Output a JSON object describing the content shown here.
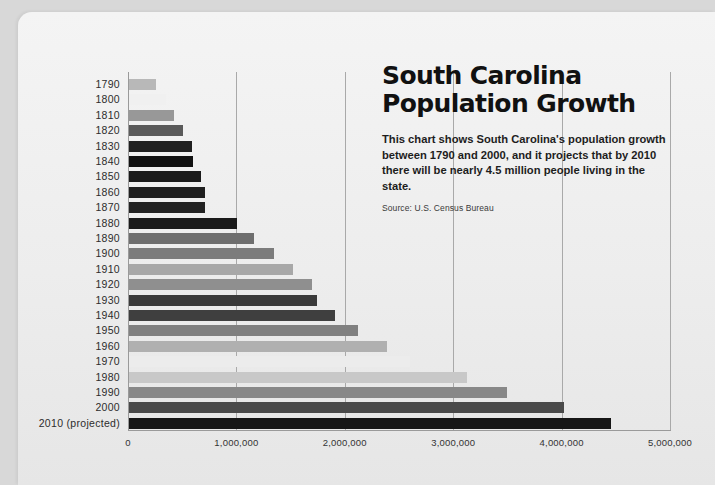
{
  "header": {
    "title_line1": "South Carolina",
    "title_line2": "Population Growth",
    "description": "This chart shows South Carolina's population growth between 1790 and 2000, and it projects that by 2010 there will be nearly 4.5 million people living in the state.",
    "source": "Source: U.S. Census Bureau"
  },
  "axis": {
    "xticks": [
      "0",
      "1,000,000",
      "2,000,000",
      "3,000,000",
      "4,000,000",
      "5,000,000"
    ]
  },
  "chart_data": {
    "type": "bar",
    "orientation": "horizontal",
    "title": "South Carolina Population Growth",
    "xlabel": "",
    "ylabel": "",
    "xlim": [
      0,
      5000000
    ],
    "grid": true,
    "legend": false,
    "categories": [
      "1790",
      "1800",
      "1810",
      "1820",
      "1830",
      "1840",
      "1850",
      "1860",
      "1870",
      "1880",
      "1890",
      "1900",
      "1910",
      "1920",
      "1930",
      "1940",
      "1950",
      "1960",
      "1970",
      "1980",
      "1990",
      "2000",
      "2010 (projected)"
    ],
    "values": [
      249073,
      345591,
      415115,
      502741,
      581185,
      594398,
      668507,
      703708,
      705606,
      995577,
      1151149,
      1340316,
      1515400,
      1683724,
      1738765,
      1899804,
      2117027,
      2382594,
      2590516,
      3121820,
      3486703,
      4012012,
      4446704
    ],
    "bar_colors": [
      "#b8b8b8",
      "#f0f0f0",
      "#989898",
      "#5a5a5a",
      "#202020",
      "#111111",
      "#1a1a1a",
      "#1f1f1f",
      "#222222",
      "#1a1a1a",
      "#6e6e6e",
      "#7c7c7c",
      "#a8a8a8",
      "#8f8f8f",
      "#3a3a3a",
      "#3f3f3f",
      "#808080",
      "#b0b0b0",
      "#ececec",
      "#c8c8c8",
      "#888888",
      "#4a4a4a",
      "#161616"
    ]
  }
}
